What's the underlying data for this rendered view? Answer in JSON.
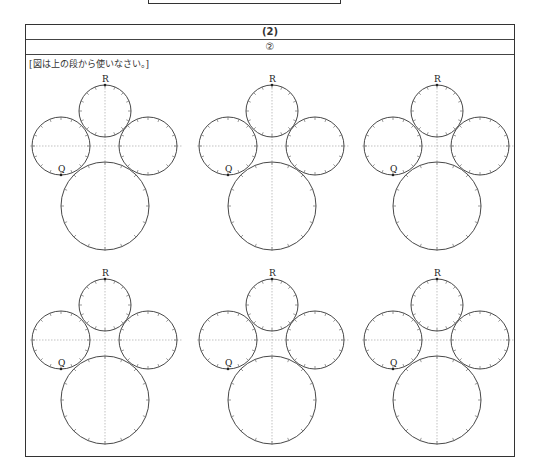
{
  "header": {
    "part_label": "(2)",
    "sub_label": "②"
  },
  "instruction": "[図は上の段から使いなさい。]",
  "figures": {
    "count": 6,
    "rows": 2,
    "columns": 3,
    "point_labels": {
      "top": "R",
      "left": "Q"
    },
    "top_row_centers_x": [
      105,
      272,
      437
    ],
    "row_offsets_y": [
      0,
      194
    ]
  }
}
